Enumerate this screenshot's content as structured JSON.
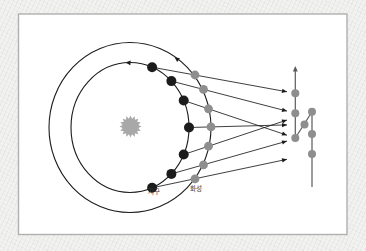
{
  "diagram": {
    "labels": {
      "earth": "지구",
      "mars": "화성"
    },
    "colors": {
      "page_background": "#f2f2f0",
      "panel_background": "#ffffff",
      "panel_border": "#b0b0b0",
      "orbit_stroke": "#1c1c1c",
      "sight_line": "#1c1c1c",
      "earth_dot": "#1c1c1c",
      "mars_dot": "#8e8e8e",
      "sun": "#a8a8a8",
      "apparent_dot": "#8e8e8e",
      "apparent_path_line": "#5a5a5a",
      "label_text": "#3a3a3a"
    },
    "orbits": {
      "inner": {
        "cx": 130,
        "cy": 127.5,
        "rx": 59,
        "ry": 65
      },
      "outer": {
        "cx": 130,
        "cy": 127.5,
        "rx": 81,
        "ry": 85
      }
    },
    "orbit_direction_arrows": {
      "inner": {
        "tip": [
          125.5,
          62.6
        ],
        "dir": [
          -1,
          -0.06
        ]
      },
      "outer": {
        "tip": [
          174.5,
          57.2
        ],
        "dir": [
          -0.82,
          -0.58
        ]
      }
    },
    "sun": {
      "center": [
        130.5,
        126.5
      ],
      "outer_radius": 11,
      "inner_radius": 8,
      "spikes": 16
    },
    "earth_positions": [
      [
        152.1,
        187.8
      ],
      [
        171.4,
        173.9
      ],
      [
        183.7,
        154.5
      ],
      [
        189,
        127.5
      ],
      [
        183.7,
        100.5
      ],
      [
        171.4,
        81.1
      ],
      [
        152.1,
        67.2
      ]
    ],
    "mars_positions": [
      [
        195,
        178.9
      ],
      [
        203.5,
        164.9
      ],
      [
        208.5,
        146.2
      ],
      [
        211,
        126.9
      ],
      [
        208.5,
        108.8
      ],
      [
        203.5,
        89.4
      ],
      [
        195,
        75
      ]
    ],
    "sight_line_arrow_tips": [
      [
        287,
        159.3
      ],
      [
        287,
        141.1
      ],
      [
        287,
        120
      ],
      [
        287,
        124.9
      ],
      [
        287,
        135.2
      ],
      [
        287,
        111.1
      ],
      [
        287,
        91.8
      ]
    ],
    "apparent_positions": [
      [
        312,
        154
      ],
      [
        312,
        134
      ],
      [
        312,
        111.7
      ],
      [
        304.5,
        124.5
      ],
      [
        295.3,
        138
      ],
      [
        295.3,
        113.3
      ],
      [
        295.3,
        93.3
      ]
    ],
    "apparent_path": {
      "right_line": {
        "from": [
          312,
          187
        ],
        "to": [
          312,
          111.7
        ]
      },
      "diagonal": {
        "from": [
          312,
          111.7
        ],
        "to": [
          295.3,
          138
        ]
      },
      "left_line": {
        "from": [
          295.3,
          138
        ],
        "to": [
          295.3,
          68
        ]
      },
      "arrow_tip": [
        295.3,
        66
      ],
      "arrow_dir": [
        0,
        -1
      ]
    },
    "panel": {
      "x": 18.5,
      "y": 14,
      "width": 328.5,
      "height": 220.5
    }
  }
}
